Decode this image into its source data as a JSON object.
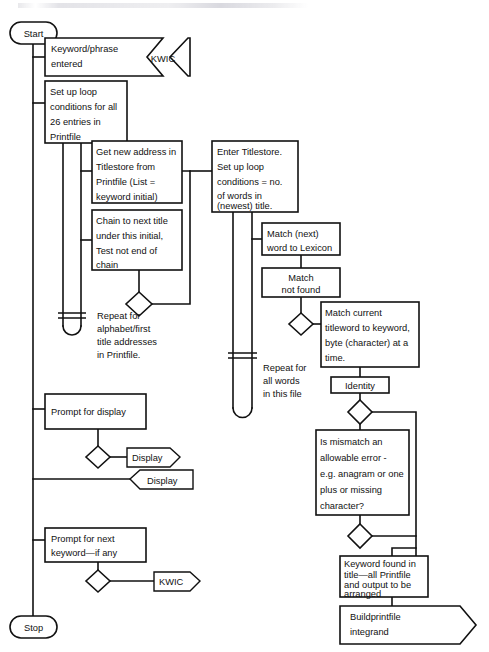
{
  "diagram": {
    "colors": {
      "stroke": "#111111",
      "fill": "#ffffff",
      "background": "#ffffff"
    },
    "terminators": {
      "start": "Start",
      "stop": "Stop"
    },
    "nodes": {
      "keyword_entered": {
        "l1": "Keyword/phrase",
        "l2": "entered"
      },
      "kwic_input": "KWIC",
      "setup_loop_printfile": {
        "l1": "Set up loop",
        "l2": "conditions for all",
        "l3": "26 entries in",
        "l4": "Printfile"
      },
      "get_new_address": {
        "l1": "Get new address in",
        "l2": "Titlestore from",
        "l3": "Printfile (List =",
        "l4": "keyword initial)"
      },
      "chain_next_title": {
        "l1": "Chain to next title",
        "l2": "under this initial,",
        "l3": "Test not end of",
        "l4": "chain"
      },
      "enter_titlestore": {
        "l1": "Enter Titlestore.",
        "l2": "Set up loop",
        "l3": "conditions = no.",
        "l4": "of words in",
        "l5": "(newest) title."
      },
      "match_next_word": {
        "l1": "Match (next)",
        "l2": "word to Lexicon"
      },
      "match_not_found": {
        "l1": "Match",
        "l2": "not found"
      },
      "match_current_titleword": {
        "l1": "Match current",
        "l2": "titleword to keyword,",
        "l3": "byte (character) at a",
        "l4": "time."
      },
      "identity": "Identity",
      "is_mismatch_allowable": {
        "l1": "Is mismatch an",
        "l2": "allowable error -",
        "l3": "e.g. anagram or one",
        "l4": "plus or missing",
        "l5": "character?"
      },
      "keyword_found": {
        "l1": "Keyword found in",
        "l2": "title—all Printfile",
        "l3": "and output to be",
        "l4": "arranged"
      },
      "buildprintfile": {
        "l1": "Buildprintfile",
        "l2": "integrand"
      },
      "prompt_display": "Prompt for display",
      "display_out": "Display",
      "display_in": "Display",
      "prompt_next_keyword": {
        "l1": "Prompt for next",
        "l2": "keyword—if any"
      },
      "kwic_loop": "KWIC"
    },
    "annotations": {
      "repeat_alphabet": {
        "l1": "Repeat for",
        "l2": "alphabet/first",
        "l3": "title addresses",
        "l4": "in Printfile."
      },
      "repeat_all_words": {
        "l1": "Repeat for",
        "l2": "all words",
        "l3": "in this file"
      }
    }
  }
}
